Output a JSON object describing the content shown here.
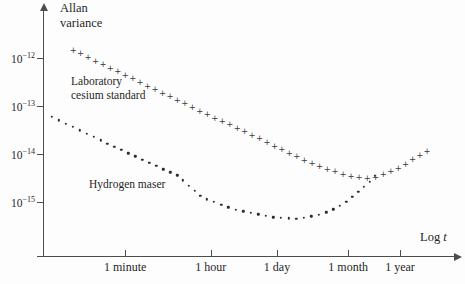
{
  "colors": {
    "background": "#fdfdfd",
    "ink": "#1f1f1f",
    "axis": "#4d4d4d",
    "marker": "#3a3a3a"
  },
  "axis_titles": {
    "y_line1": "Allan",
    "y_line2": "variance",
    "x_prefix": "Log ",
    "x_variable": "t"
  },
  "chart_data": {
    "type": "scatter",
    "title": "",
    "ylabel": "Allan variance",
    "xlabel": "Log t",
    "y_scale": "log",
    "x_scale": "log",
    "x_ticks": [
      {
        "label": "1 minute",
        "log10_seconds": 1.78
      },
      {
        "label": "1 hour",
        "log10_seconds": 3.56
      },
      {
        "label": "1 day",
        "log10_seconds": 4.94
      },
      {
        "label": "1 month",
        "log10_seconds": 6.42
      },
      {
        "label": "1 year",
        "log10_seconds": 7.5
      }
    ],
    "y_ticks": [
      {
        "base": "10",
        "exp": "−12",
        "log10_value": -12
      },
      {
        "base": "10",
        "exp": "−13",
        "log10_value": -13
      },
      {
        "base": "10",
        "exp": "−14",
        "log10_value": -14
      },
      {
        "base": "10",
        "exp": "−15",
        "log10_value": -15
      }
    ],
    "series": [
      {
        "key": "cesium",
        "name": "Laboratory cesium standard",
        "label_lines": [
          "Laboratory",
          "cesium standard"
        ],
        "marker": "plus",
        "glyph": "+",
        "marker_count": 48,
        "points_log10": [
          [
            0.7,
            -11.83
          ],
          [
            2.09,
            -12.5
          ],
          [
            3.34,
            -13.1
          ],
          [
            4.38,
            -13.58
          ],
          [
            5.42,
            -14.08
          ],
          [
            6.04,
            -14.33
          ],
          [
            6.46,
            -14.46
          ],
          [
            6.77,
            -14.5
          ],
          [
            7.08,
            -14.46
          ],
          [
            7.5,
            -14.27
          ],
          [
            7.81,
            -14.08
          ],
          [
            8.06,
            -13.94
          ]
        ]
      },
      {
        "key": "maser",
        "name": "Hydrogen maser",
        "label_lines": [
          "Hydrogen maser"
        ],
        "marker": "dot",
        "glyph": "•",
        "marker_count": 48,
        "points_log10": [
          [
            0.26,
            -13.23
          ],
          [
            1.47,
            -13.81
          ],
          [
            2.51,
            -14.29
          ],
          [
            2.86,
            -14.44
          ],
          [
            3.4,
            -14.92
          ],
          [
            4.11,
            -15.17
          ],
          [
            4.79,
            -15.31
          ],
          [
            5.31,
            -15.35
          ],
          [
            5.73,
            -15.29
          ],
          [
            6.04,
            -15.19
          ],
          [
            6.35,
            -15.02
          ],
          [
            6.67,
            -14.75
          ],
          [
            6.87,
            -14.58
          ],
          [
            6.98,
            -14.46
          ]
        ]
      }
    ]
  }
}
